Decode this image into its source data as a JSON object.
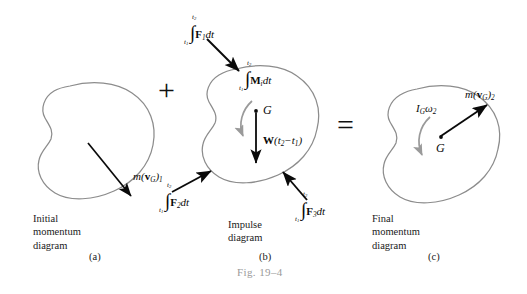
{
  "figure": {
    "number": "Fig. 19–4",
    "width": 527,
    "height": 294,
    "background": "#ffffff",
    "body_outline_color": "#8c8c8c",
    "arrow_color": "#0a0a0a",
    "moment_arc_color": "#9a9a9a",
    "text_color": "#0a0a0a",
    "figno_color": "#9a9a9a"
  },
  "operators": {
    "plus": "+",
    "equals": "="
  },
  "panels": {
    "initial": {
      "letter": "(a)",
      "caption_line1": "Initial",
      "caption_line2": "momentum",
      "caption_line3": "diagram",
      "momentum_label": {
        "m": "m",
        "open": "(",
        "v": "v",
        "v_sub": "G",
        "close": ")",
        "time_sub": "1"
      }
    },
    "impulse": {
      "letter": "(b)",
      "caption_line1": "Impulse",
      "caption_line2": "diagram",
      "center_point": "G",
      "moment_impulse": {
        "lim_top": "t",
        "lim_top_sub": "2",
        "lim_bot": "t",
        "lim_bot_sub": "1",
        "integrand": "M",
        "integrand_sub": "i",
        "dt": "dt"
      },
      "weight_impulse": {
        "w": "W",
        "open": "(",
        "t2": "t",
        "t2_sub": "2",
        "minus": "−",
        "t1": "t",
        "t1_sub": "1",
        "close": ")"
      },
      "force_impulses": [
        {
          "name": "F1",
          "lim_top": "t",
          "lim_top_sub": "2",
          "lim_bot": "t",
          "lim_bot_sub": "1",
          "integrand": "F",
          "integrand_sub": "1",
          "dt": "dt"
        },
        {
          "name": "F2",
          "lim_top": "t",
          "lim_top_sub": "2",
          "lim_bot": "t",
          "lim_bot_sub": "1",
          "integrand": "F",
          "integrand_sub": "2",
          "dt": "dt"
        },
        {
          "name": "F3",
          "lim_top": "t",
          "lim_top_sub": "2",
          "lim_bot": "t",
          "lim_bot_sub": "1",
          "integrand": "F",
          "integrand_sub": "3",
          "dt": "dt"
        }
      ]
    },
    "final": {
      "letter": "(c)",
      "caption_line1": "Final",
      "caption_line2": "momentum",
      "caption_line3": "diagram",
      "center_point": "G",
      "angular_momentum": {
        "i": "I",
        "i_sub": "G",
        "omega": "ω",
        "omega_sub": "2"
      },
      "momentum_label": {
        "m": "m",
        "open": "(",
        "v": "v",
        "v_sub": "G",
        "close": ")",
        "time_sub": "2"
      }
    }
  }
}
